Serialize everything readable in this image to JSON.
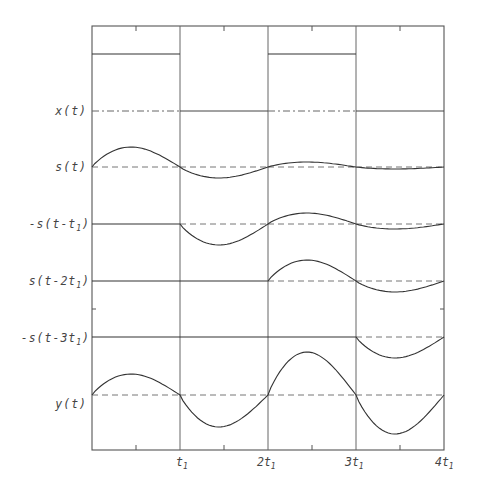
{
  "figure": {
    "title": "",
    "signals": [
      {
        "id": "x",
        "label": "x(t)",
        "label_parts": [
          "x(t)"
        ]
      },
      {
        "id": "s",
        "label": "s(t)"
      },
      {
        "id": "s1",
        "label": "-s(t-t1)",
        "label_main": "-s(t-t",
        "label_sub": "1",
        "label_end": ")"
      },
      {
        "id": "s2",
        "label": "s(t-2t1)",
        "label_main": "s(t-2t",
        "label_sub": "1",
        "label_end": ")"
      },
      {
        "id": "s3",
        "label": "-s(t-3t1)",
        "label_main": "-s(t-3t",
        "label_sub": "1",
        "label_end": ")"
      },
      {
        "id": "y",
        "label": "y(t)"
      }
    ],
    "x_ticks": [
      {
        "main": "t",
        "sub": "1",
        "label": "t1"
      },
      {
        "main": "2t",
        "sub": "1",
        "label": "2t1"
      },
      {
        "main": "3t",
        "sub": "1",
        "label": "3t1"
      },
      {
        "main": "4t",
        "sub": "1",
        "label": "4t1"
      }
    ]
  },
  "chart_data": {
    "type": "line",
    "xlabel": "t",
    "ylabel": "",
    "x_tick_labels": [
      "t1",
      "2t1",
      "3t1",
      "4t1"
    ],
    "x_range": [
      0,
      4
    ],
    "grid": "vertical lines at t1, 2t1, 3t1",
    "note": "Amplitudes are relative (estimated from pixels); each trace plotted on its own baseline. Segments are intervals [k*t1,(k+1)*t1].",
    "series": [
      {
        "name": "x(t)",
        "kind": "square",
        "values_per_interval": [
          1,
          0,
          1,
          0
        ]
      },
      {
        "name": "s(t)",
        "kind": "damped-oscillation",
        "peak_per_interval": [
          1.0,
          -0.55,
          0.25,
          -0.1
        ]
      },
      {
        "name": "-s(t-t1)",
        "kind": "damped-oscillation",
        "peak_per_interval": [
          0,
          -1.0,
          0.55,
          -0.25
        ]
      },
      {
        "name": "s(t-2t1)",
        "kind": "damped-oscillation",
        "peak_per_interval": [
          0,
          0,
          1.0,
          -0.55
        ]
      },
      {
        "name": "-s(t-3t1)",
        "kind": "damped-oscillation",
        "peak_per_interval": [
          0,
          0,
          0,
          -1.0
        ]
      },
      {
        "name": "y(t)",
        "kind": "sum",
        "peak_per_interval": [
          1.0,
          -1.55,
          2.0,
          -1.9
        ]
      }
    ]
  },
  "layout": {
    "frame": {
      "left": 92,
      "top": 26,
      "right": 444,
      "bottom": 450
    },
    "segment_width": 88,
    "baselines": {
      "x": 111,
      "s": 167,
      "s1": 224,
      "s2": 281,
      "s3": 337,
      "y": 395
    },
    "x_high": 54,
    "amp_px": {
      "s": [
        20,
        -11,
        5,
        -2
      ],
      "s1": [
        0,
        -21,
        11,
        -5
      ],
      "s2": [
        0,
        0,
        21,
        -11
      ],
      "s3": [
        0,
        0,
        0,
        -21
      ],
      "y": [
        21,
        -32,
        43,
        -39
      ]
    }
  }
}
